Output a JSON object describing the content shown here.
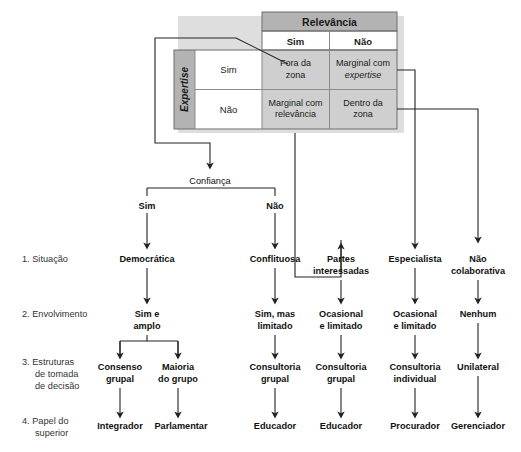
{
  "matrix": {
    "col_header": "Relevância",
    "row_header": "Expertise",
    "col_labels": [
      "Sim",
      "Não"
    ],
    "row_labels": [
      "Sim",
      "Não"
    ],
    "cells": [
      {
        "line1": "Fora da",
        "line2": "zona",
        "italic_line": ""
      },
      {
        "line1": "Marginal com",
        "line2": "",
        "italic_line": "expertise"
      },
      {
        "line1": "Marginal com",
        "line2": "relevância",
        "italic_line": ""
      },
      {
        "line1": "Dentro da",
        "line2": "zona",
        "italic_line": ""
      }
    ],
    "colors": {
      "header_fill": "#b3b3b3",
      "cell_fill": "#cfcfcf",
      "label_fill": "#ffffff",
      "shadow": "#d9d9d9"
    }
  },
  "decision": {
    "label": "Confiança",
    "branch_yes": "Sim",
    "branch_no": "Não"
  },
  "stages": [
    {
      "num": "1.",
      "name": "Situação",
      "lines": [
        "1. Situação"
      ]
    },
    {
      "num": "2.",
      "name": "Envolvimento",
      "lines": [
        "2. Envolvimento"
      ]
    },
    {
      "num": "3.",
      "name": "Estruturas de tomada de decisão",
      "lines": [
        "3. Estruturas",
        "de tomada",
        "de decisão"
      ]
    },
    {
      "num": "4.",
      "name": "Papel do superior",
      "lines": [
        "4. Papel do",
        "superior"
      ]
    }
  ],
  "columns": [
    {
      "id": "democratica",
      "situacao": [
        "Democrática"
      ],
      "envolvimento": [
        "Sim e",
        "amplo"
      ],
      "estruturas": [
        [
          "Consenso",
          "grupal"
        ],
        [
          "Maioria",
          "do grupo"
        ]
      ],
      "papel": [
        "Integrador",
        "Parlamentar"
      ]
    },
    {
      "id": "conflituosa",
      "situacao": [
        "Conflituosa"
      ],
      "envolvimento": [
        "Sim, mas",
        "limitado"
      ],
      "estruturas": [
        [
          "Consultoria",
          "grupal"
        ]
      ],
      "papel": [
        "Educador"
      ]
    },
    {
      "id": "partes-interessadas",
      "situacao": [
        "Partes",
        "interessadas"
      ],
      "envolvimento": [
        "Ocasional",
        "e limitado"
      ],
      "estruturas": [
        [
          "Consultoria",
          "grupal"
        ]
      ],
      "papel": [
        "Educador"
      ]
    },
    {
      "id": "especialista",
      "situacao": [
        "Especialista"
      ],
      "envolvimento": [
        "Ocasional",
        "e limitado"
      ],
      "estruturas": [
        [
          "Consultoria",
          "individual"
        ]
      ],
      "papel": [
        "Procurador"
      ]
    },
    {
      "id": "nao-colaborativa",
      "situacao": [
        "Não",
        "colaborativa"
      ],
      "envolvimento": [
        "Nenhum"
      ],
      "estruturas": [
        [
          "Unilateral"
        ]
      ],
      "papel": [
        "Gerenciador"
      ]
    }
  ],
  "flat": {
    "s1_c1": "Democrática",
    "s1_c2": "Conflituosa",
    "s1_c3a": "Partes",
    "s1_c3b": "interessadas",
    "s1_c4": "Especialista",
    "s1_c5a": "Não",
    "s1_c5b": "colaborativa",
    "s2_c1a": "Sim e",
    "s2_c1b": "amplo",
    "s2_c2a": "Sim, mas",
    "s2_c2b": "limitado",
    "s2_c3a": "Ocasional",
    "s2_c3b": "e limitado",
    "s2_c4a": "Ocasional",
    "s2_c4b": "e limitado",
    "s2_c5": "Nenhum",
    "s3_c1a": "Consenso",
    "s3_c1b": "grupal",
    "s3_c1c": "Maioria",
    "s3_c1d": "do grupo",
    "s3_c2a": "Consultoria",
    "s3_c2b": "grupal",
    "s3_c3a": "Consultoria",
    "s3_c3b": "grupal",
    "s3_c4a": "Consultoria",
    "s3_c4b": "individual",
    "s3_c5": "Unilateral",
    "s4_c1a": "Integrador",
    "s4_c1b": "Parlamentar",
    "s4_c2": "Educador",
    "s4_c3": "Educador",
    "s4_c4": "Procurador",
    "s4_c5": "Gerenciador",
    "lbl1": "1. Situação",
    "lbl2": "2. Envolvimento",
    "lbl3a": "3. Estruturas",
    "lbl3b": "de tomada",
    "lbl3c": "de decisão",
    "lbl4a": "4. Papel do",
    "lbl4b": "superior",
    "m_relevancia": "Relevância",
    "m_expertise": "Expertise",
    "m_col_sim": "Sim",
    "m_col_nao": "Não",
    "m_row_sim": "Sim",
    "m_row_nao": "Não",
    "m_c1a": "Fora da",
    "m_c1b": "zona",
    "m_c2a": "Marginal com",
    "m_c2b": "expertise",
    "m_c3a": "Marginal com",
    "m_c3b": "relevância",
    "m_c4a": "Dentro da",
    "m_c4b": "zona",
    "conf": "Confiança",
    "conf_sim": "Sim",
    "conf_nao": "Não"
  }
}
